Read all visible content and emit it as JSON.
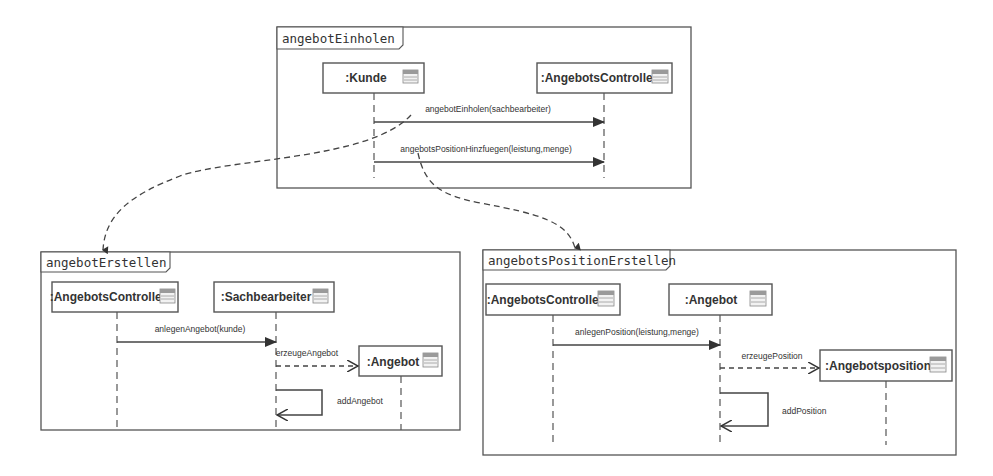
{
  "frames": [
    {
      "id": "angebotEinholen",
      "label": "angebotEinholen",
      "lifelines": [
        {
          "label": ":Kunde",
          "icon": "class-icon"
        },
        {
          "label": ":AngebotsController",
          "icon": "class-icon"
        }
      ],
      "messages": [
        {
          "label": "angebotEinholen(sachbearbeiter)",
          "from": ":Kunde",
          "to": ":AngebotsController",
          "type": "synchronous"
        },
        {
          "label": "angebotsPositionHinzfuegen(leistung,menge)",
          "from": ":Kunde",
          "to": ":AngebotsController",
          "type": "synchronous"
        }
      ]
    },
    {
      "id": "angebotErstellen",
      "label": "angebotErstellen",
      "lifelines": [
        {
          "label": ":AngebotsController",
          "icon": "class-icon"
        },
        {
          "label": ":Sachbearbeiter",
          "icon": "class-icon"
        },
        {
          "label": ":Angebot",
          "icon": "class-icon"
        }
      ],
      "messages": [
        {
          "label": "anlegenAngebot(kunde)",
          "from": ":AngebotsController",
          "to": ":Sachbearbeiter",
          "type": "synchronous"
        },
        {
          "label": "erzeugeAngebot",
          "from": ":Sachbearbeiter",
          "to": ":Angebot",
          "type": "create"
        },
        {
          "label": "addAngebot",
          "from": ":Sachbearbeiter",
          "to": ":Sachbearbeiter",
          "type": "self"
        }
      ]
    },
    {
      "id": "angebotsPositionErstellen",
      "label": "angebotsPositionErstellen",
      "lifelines": [
        {
          "label": ":AngebotsController",
          "icon": "class-icon"
        },
        {
          "label": ":Angebot",
          "icon": "class-icon"
        },
        {
          "label": ":Angebotsposition",
          "icon": "class-icon"
        }
      ],
      "messages": [
        {
          "label": "anlegenPosition(leistung,menge)",
          "from": ":AngebotsController",
          "to": ":Angebot",
          "type": "synchronous"
        },
        {
          "label": "erzeugePosition",
          "from": ":Angebot",
          "to": ":Angebotsposition",
          "type": "create"
        },
        {
          "label": "addPosition",
          "from": ":Angebot",
          "to": ":Angebot",
          "type": "self"
        }
      ]
    }
  ],
  "links": [
    {
      "from": "angebotEinholen(sachbearbeiter)",
      "to": "angebotErstellen"
    },
    {
      "from": "angebotsPositionHinzfuegen(leistung,menge)",
      "to": "angebotsPositionErstellen"
    }
  ]
}
